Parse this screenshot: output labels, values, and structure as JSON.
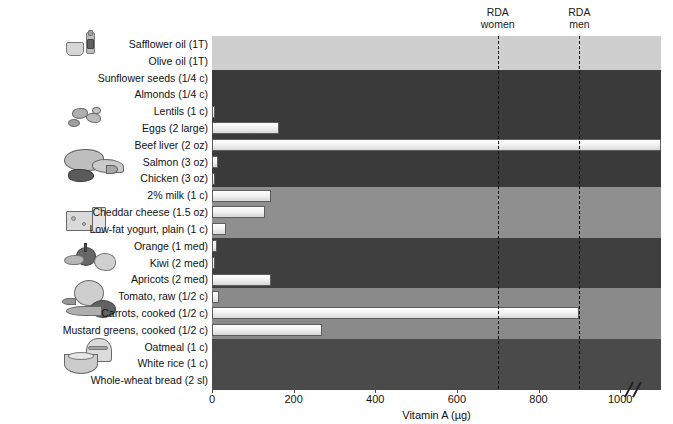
{
  "chart_data": {
    "type": "bar",
    "orientation": "horizontal",
    "title": "",
    "xlabel": "Vitamin A (µg)",
    "ylabel": "",
    "xlim": [
      0,
      1100
    ],
    "xticks": [
      0,
      200,
      400,
      600,
      800,
      1000
    ],
    "xtick_labels": [
      "0",
      "200",
      "400",
      "600",
      "800",
      "1000"
    ],
    "grid": false,
    "axis_break": true,
    "axis_break_note": "Axis break near 1050; Beef liver bar runs off scale",
    "categories": [
      "Safflower oil (1T)",
      "Olive oil (1T)",
      "Sunflower seeds (1/4 c)",
      "Almonds (1/4 c)",
      "Lentils (1 c)",
      "Eggs (2 large)",
      "Beef liver (2 oz)",
      "Salmon (3 oz)",
      "Chicken (3 oz)",
      "2% milk (1 c)",
      "Cheddar cheese (1.5 oz)",
      "Low-fat yogurt, plain (1 c)",
      "Orange (1 med)",
      "Kiwi (2 med)",
      "Apricots (2 med)",
      "Tomato, raw (1/2 c)",
      "Carrots, cooked (1/2 c)",
      "Mustard greens, cooked (1/2 c)",
      "Oatmeal (1 c)",
      "White rice (1 c)",
      "Whole-wheat bread (2 sl)"
    ],
    "values": [
      0,
      0,
      0,
      0,
      5,
      165,
      1100,
      15,
      8,
      145,
      130,
      35,
      12,
      8,
      145,
      18,
      900,
      270,
      0,
      0,
      0
    ],
    "annotations": [
      {
        "label": "RDA women",
        "value": 700,
        "style": "dashed-vertical"
      },
      {
        "label": "RDA men",
        "value": 900,
        "style": "dashed-vertical"
      }
    ],
    "groups": [
      {
        "name": "oils",
        "rows": [
          0,
          1
        ],
        "shade": "#cfcfcf"
      },
      {
        "name": "nuts-seeds-legumes-protein",
        "rows": [
          2,
          3,
          4,
          5,
          6,
          7,
          8
        ],
        "shade": "#3a3a3a"
      },
      {
        "name": "dairy",
        "rows": [
          9,
          10,
          11
        ],
        "shade": "#8f8f8f"
      },
      {
        "name": "fruits",
        "rows": [
          12,
          13,
          14
        ],
        "shade": "#3f3f3f"
      },
      {
        "name": "vegetables",
        "rows": [
          15,
          16,
          17
        ],
        "shade": "#8a8a8a"
      },
      {
        "name": "grains",
        "rows": [
          18,
          19,
          20
        ],
        "shade": "#4a4a4a"
      }
    ]
  },
  "annotations": {
    "rda_women": {
      "line1": "RDA",
      "line2": "women"
    },
    "rda_men": {
      "line1": "RDA",
      "line2": "men"
    }
  },
  "axis": {
    "x_title": "Vitamin A (µg)",
    "ticks": [
      "0",
      "200",
      "400",
      "600",
      "800",
      "1000"
    ]
  },
  "illustrations": [
    {
      "name": "oil-bottle-and-cup",
      "group": "oils"
    },
    {
      "name": "nuts-and-seeds",
      "group": "nuts-seeds-legumes"
    },
    {
      "name": "meat-fish-poultry",
      "group": "protein"
    },
    {
      "name": "cheese-wedge-and-milk-glass",
      "group": "dairy"
    },
    {
      "name": "fruit-basket",
      "group": "fruits"
    },
    {
      "name": "vegetables-cabbage-carrot-tomato",
      "group": "vegetables"
    },
    {
      "name": "bread-and-cereal-bowl",
      "group": "grains"
    }
  ],
  "colors": {
    "bar_fill": "#f2f2f2",
    "bar_edge": "#5c5c5c",
    "rda_line": "#111111",
    "text": "#111111",
    "background": "#ffffff"
  }
}
